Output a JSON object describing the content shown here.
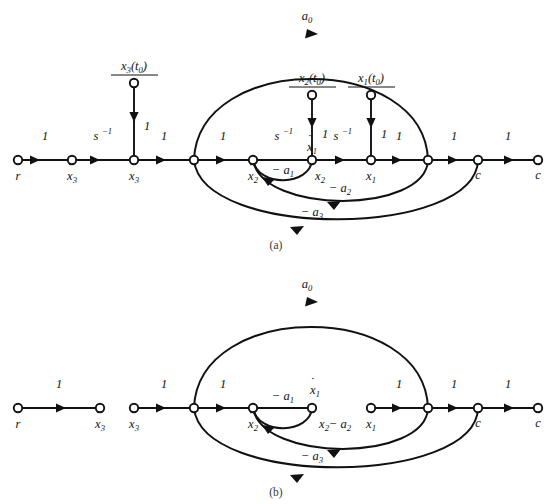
{
  "figure": {
    "background_color": "#ffffff",
    "ink_color": "#111111",
    "panels": [
      {
        "id": "a",
        "caption": "(a)",
        "description": "Complete signal flow graph including initial-condition input branches"
      },
      {
        "id": "b",
        "caption": "(b)",
        "description": "Reduced signal flow graph with initial-condition branches and intermediate links removed"
      }
    ]
  },
  "symbols": {
    "r": "r",
    "c": "c",
    "x1": "x",
    "x2": "x",
    "x3": "x",
    "one": "1",
    "s_inv_base": "s",
    "s_inv_exp": "−1",
    "a0": "a",
    "a1": "− a",
    "a2": "− a",
    "a3": "− a",
    "sub_0": "0",
    "sub_1": "1",
    "sub_2": "2",
    "sub_3": "3",
    "t0_num_base": "x",
    "t0_paren": "(t",
    "t0_close": ")",
    "denom_s": "s",
    "dot": "˙"
  },
  "panel_a": {
    "caption": "(a)",
    "nodes": [
      {
        "name": "r",
        "label": "r",
        "sub": "",
        "dot": false,
        "x": 18,
        "y": 160
      },
      {
        "name": "xdot3",
        "label": "x",
        "sub": "3",
        "dot": true,
        "x": 72,
        "y": 160
      },
      {
        "name": "x3",
        "label": "x",
        "sub": "3",
        "dot": false,
        "x": 134,
        "y": 160
      },
      {
        "name": "junction1",
        "label": "",
        "sub": "",
        "dot": false,
        "x": 194,
        "y": 160
      },
      {
        "name": "xdot2",
        "label": "x",
        "sub": "2",
        "dot": true,
        "x": 253,
        "y": 160
      },
      {
        "name": "x2",
        "label": "x",
        "sub": "2",
        "dot": false,
        "x": 312,
        "y": 160
      },
      {
        "name": "x1",
        "label": "x",
        "sub": "1",
        "dot": false,
        "x": 371,
        "y": 160
      },
      {
        "name": "junction2",
        "label": "",
        "sub": "",
        "dot": false,
        "x": 428,
        "y": 160
      },
      {
        "name": "c-inner",
        "label": "c",
        "sub": "",
        "dot": false,
        "x": 478,
        "y": 160
      },
      {
        "name": "c-outer",
        "label": "c",
        "sub": "",
        "dot": false,
        "x": 538,
        "y": 160
      },
      {
        "name": "ic3",
        "label": "",
        "sub": "",
        "dot": false,
        "x": 134,
        "y": 83
      },
      {
        "name": "ic2",
        "label": "",
        "sub": "",
        "dot": false,
        "x": 312,
        "y": 95
      },
      {
        "name": "ic1",
        "label": "",
        "sub": "",
        "dot": false,
        "x": 371,
        "y": 95
      }
    ],
    "forward_gains": [
      {
        "name": "gain-r-xdot3",
        "text": "1",
        "type": "plain",
        "x": 45,
        "y": 140
      },
      {
        "name": "gain-xdot3-x3",
        "text": "s",
        "type": "sinv",
        "x": 100,
        "y": 140
      },
      {
        "name": "gain-x3-junction1",
        "text": "1",
        "type": "plain",
        "x": 164,
        "y": 140
      },
      {
        "name": "gain-junction1-xdot2",
        "text": "1",
        "type": "plain",
        "x": 223,
        "y": 140
      },
      {
        "name": "gain-xdot2-x2",
        "text": "s",
        "type": "sinv",
        "x": 281,
        "y": 140
      },
      {
        "name": "gain-x2-x1",
        "text": "s",
        "type": "sinv",
        "x": 340,
        "y": 140
      },
      {
        "name": "gain-x1-junction2",
        "text": "1",
        "type": "plain",
        "x": 399,
        "y": 140
      },
      {
        "name": "gain-junction2-c",
        "text": "1",
        "type": "plain",
        "x": 454,
        "y": 140
      },
      {
        "name": "gain-c-c",
        "text": "1",
        "type": "plain",
        "x": 508,
        "y": 140
      }
    ],
    "ic_branches": [
      {
        "name": "ic-branch-x3",
        "numerator_var": "x",
        "numerator_sub": "3",
        "numerator_arg": "(t",
        "numerator_arg_sub": "0",
        "numerator_close": ")",
        "denominator": "s",
        "gain": "1",
        "source_x": 134,
        "source_y": 83,
        "target_x": 134,
        "target_y": 160
      },
      {
        "name": "ic-branch-x2",
        "numerator_var": "x",
        "numerator_sub": "2",
        "numerator_arg": "(t",
        "numerator_arg_sub": "0",
        "numerator_close": ")",
        "denominator": "s",
        "gain": "1",
        "source_x": 312,
        "source_y": 95,
        "target_x": 312,
        "target_y": 160
      },
      {
        "name": "ic-branch-x1",
        "numerator_var": "x",
        "numerator_sub": "1",
        "numerator_arg": "(t",
        "numerator_arg_sub": "0",
        "numerator_close": ")",
        "denominator": "s",
        "gain": "1",
        "source_x": 371,
        "source_y": 95,
        "target_x": 371,
        "target_y": 160
      }
    ],
    "feedback_arcs": [
      {
        "name": "arc-a1",
        "label_sign": "− a",
        "label_sub": "1",
        "label_x": 283,
        "label_y": 173,
        "from_x": 312,
        "to_x": 253,
        "depth": 22
      },
      {
        "name": "arc-a2",
        "label_sign": "− a",
        "label_sub": "2",
        "label_x": 338,
        "label_y": 189,
        "from_x": 428,
        "to_x": 253,
        "depth": 42
      },
      {
        "name": "arc-a3",
        "label_sign": "− a",
        "label_sub": "3",
        "label_x": 310,
        "label_y": 213,
        "from_x": 478,
        "to_x": 194,
        "depth": 68
      }
    ],
    "forward_arc": {
      "name": "arc-a0",
      "label_base": "a",
      "label_sub": "0",
      "label_x": 307,
      "label_y": 20,
      "from_x": 194,
      "to_x": 428,
      "apex_y": 36
    },
    "xdot1_label": {
      "name": "xdot1-label",
      "text": "x",
      "sub": "1",
      "x": 312,
      "y": 150
    }
  },
  "panel_b": {
    "caption": "(b)",
    "nodes": [
      {
        "name": "r",
        "label": "r",
        "sub": "",
        "dot": false,
        "x": 18,
        "y": 408
      },
      {
        "name": "xdot3",
        "label": "x",
        "sub": "3",
        "dot": true,
        "x": 100,
        "y": 408
      },
      {
        "name": "x3",
        "label": "x",
        "sub": "3",
        "dot": false,
        "x": 134,
        "y": 408
      },
      {
        "name": "junction1",
        "label": "",
        "sub": "",
        "dot": false,
        "x": 194,
        "y": 408
      },
      {
        "name": "xdot2",
        "label": "x",
        "sub": "2",
        "dot": true,
        "x": 253,
        "y": 408
      },
      {
        "name": "x2",
        "label": "x",
        "sub": "2",
        "dot": false,
        "x": 312,
        "y": 408
      },
      {
        "name": "x1",
        "label": "x",
        "sub": "1",
        "dot": false,
        "x": 371,
        "y": 408
      },
      {
        "name": "junction2",
        "label": "",
        "sub": "",
        "dot": false,
        "x": 428,
        "y": 408
      },
      {
        "name": "c-inner",
        "label": "c",
        "sub": "",
        "dot": false,
        "x": 478,
        "y": 408
      },
      {
        "name": "c-outer",
        "label": "c",
        "sub": "",
        "dot": false,
        "x": 538,
        "y": 408
      }
    ],
    "forward_gains": [
      {
        "name": "gain-r-xdot3",
        "text": "1",
        "x": 59,
        "y": 388
      },
      {
        "name": "gain-x3-junction1",
        "text": "1",
        "x": 164,
        "y": 388
      },
      {
        "name": "gain-junction1-xdot2",
        "text": "1",
        "x": 223,
        "y": 388
      },
      {
        "name": "gain-x1-junction2",
        "text": "1",
        "x": 399,
        "y": 388
      },
      {
        "name": "gain-junction2-c",
        "text": "1",
        "x": 454,
        "y": 388
      },
      {
        "name": "gain-c-c",
        "text": "1",
        "x": 508,
        "y": 388
      }
    ],
    "feedback_arcs": [
      {
        "name": "arc-a1",
        "label_sign": "− a",
        "label_sub": "1",
        "label_x": 283,
        "label_y": 398,
        "from_x": 312,
        "to_x": 253,
        "depth": 22
      },
      {
        "name": "arc-a2",
        "label_sign": "− a",
        "label_sub": "2",
        "label_x": 338,
        "label_y": 420,
        "from_x": 428,
        "to_x": 253,
        "depth": 42
      },
      {
        "name": "arc-a3",
        "label_sign": "− a",
        "label_sub": "3",
        "label_x": 310,
        "label_y": 452,
        "from_x": 478,
        "to_x": 194,
        "depth": 68
      }
    ],
    "forward_arc": {
      "name": "arc-a0",
      "label_base": "a",
      "label_sub": "0",
      "label_x": 307,
      "label_y": 288,
      "from_x": 194,
      "to_x": 428,
      "apex_y": 300
    },
    "xdot1_label": {
      "name": "xdot1-label",
      "text": "x",
      "sub": "1",
      "x": 312,
      "y": 392
    }
  }
}
